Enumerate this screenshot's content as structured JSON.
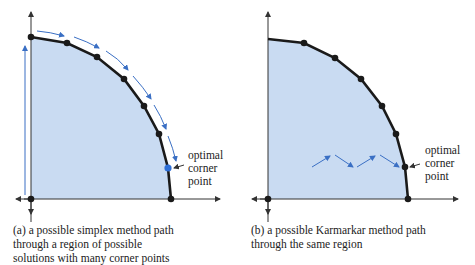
{
  "panels": [
    {
      "id": "a",
      "caption_lines": [
        "(a) a possible simplex method path",
        "through a region of possible",
        "solutions with many corner points"
      ],
      "annotation_lines": [
        "optimal",
        "corner",
        "point"
      ]
    },
    {
      "id": "b",
      "caption_lines": [
        "(b) a possible Karmarkar method path",
        "through the same region"
      ],
      "annotation_lines": [
        "optimal",
        "corner",
        "point"
      ]
    }
  ],
  "colors": {
    "region_fill": "#c9dbf2",
    "boundary": "#1a1a1a",
    "path_arrow": "#3a6fc4",
    "optimal_point_a": "#2f6fd6"
  }
}
